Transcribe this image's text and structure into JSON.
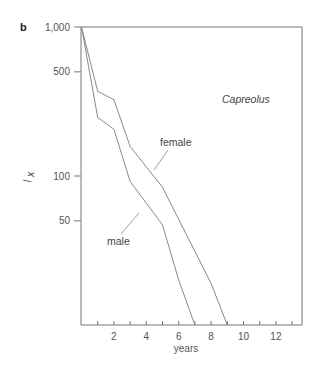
{
  "panel_label": "b",
  "chart_data": {
    "type": "line",
    "title": "",
    "annotation": "Capreolus",
    "xlabel": "years",
    "ylabel": "l_x",
    "yscale": "log",
    "ylim": [
      10,
      1000
    ],
    "xlim": [
      0,
      13.5
    ],
    "xticks": [
      1,
      2,
      3,
      4,
      5,
      6,
      7,
      8,
      9,
      10,
      11,
      12,
      13
    ],
    "xtick_labels": [
      "2",
      "4",
      "6",
      "8",
      "10",
      "12"
    ],
    "xtick_label_values": [
      2,
      4,
      6,
      8,
      10,
      12
    ],
    "yticks": [
      1000,
      500,
      100,
      50
    ],
    "ytick_labels": [
      "1,000",
      "500",
      "100",
      "50"
    ],
    "grid": false,
    "legend": "inline labels with leader lines",
    "series": [
      {
        "name": "female",
        "x": [
          0,
          1,
          2,
          3,
          5,
          8,
          9
        ],
        "values": [
          1000,
          370,
          325,
          158,
          84,
          19,
          10
        ]
      },
      {
        "name": "male",
        "x": [
          0,
          1,
          2,
          3,
          5,
          6,
          7
        ],
        "values": [
          1000,
          247,
          206,
          92,
          47,
          20,
          10
        ]
      }
    ]
  },
  "labels": {
    "xlabel": "years",
    "ylabel_main": "l",
    "ylabel_sub": "x",
    "female": "female",
    "male": "male",
    "species": "Capreolus"
  },
  "colors": {
    "axis": "#777777",
    "line": "#888888",
    "text": "#555555"
  }
}
